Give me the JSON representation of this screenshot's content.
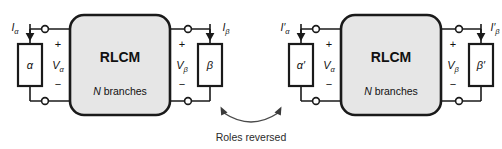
{
  "figure": {
    "caption": "Roles reversed",
    "colors": {
      "box_fill": "#e6e6e6",
      "line": "#1a1a1a",
      "caption": "#2b2b2b",
      "background": "#ffffff"
    }
  },
  "circuits": [
    {
      "id": "unprimed",
      "network": {
        "title": "RLCM",
        "subtitle_italic": "N",
        "subtitle_rest": " branches"
      },
      "left_port": {
        "element_label": "α",
        "current_symbol": "I",
        "current_sub": "α",
        "current_prime": "",
        "voltage_symbol": "V",
        "voltage_sub": "α",
        "voltage_prime": "",
        "plus": "+",
        "minus": "−"
      },
      "right_port": {
        "element_label": "β",
        "current_symbol": "I",
        "current_sub": "β",
        "current_prime": "",
        "voltage_symbol": "V",
        "voltage_sub": "β",
        "voltage_prime": "",
        "plus": "+",
        "minus": "−"
      }
    },
    {
      "id": "primed",
      "network": {
        "title": "RLCM",
        "subtitle_italic": "N",
        "subtitle_rest": " branches"
      },
      "left_port": {
        "element_label": "α′",
        "current_symbol": "I",
        "current_sub": "α",
        "current_prime": "′",
        "voltage_symbol": "V",
        "voltage_sub": "α",
        "voltage_prime": "",
        "plus": "+",
        "minus": "−"
      },
      "right_port": {
        "element_label": "β′",
        "current_symbol": "I",
        "current_sub": "β",
        "current_prime": "′",
        "voltage_symbol": "V",
        "voltage_sub": "β",
        "voltage_prime": "",
        "plus": "+",
        "minus": "−"
      }
    }
  ]
}
